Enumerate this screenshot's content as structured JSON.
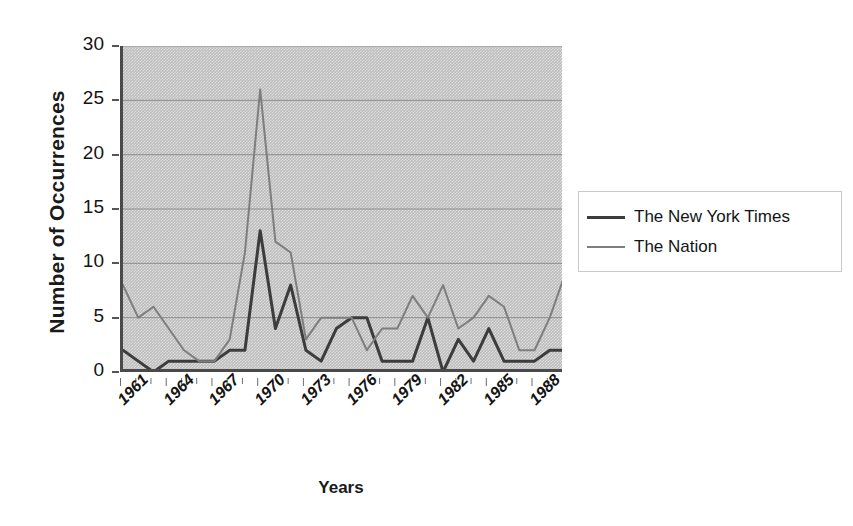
{
  "chart_data": {
    "type": "line",
    "title": "",
    "xlabel": "Years",
    "ylabel": "Number of Occurrences",
    "ylim": [
      0,
      30
    ],
    "ytick_labels": [
      "30",
      "25",
      "20",
      "15",
      "10",
      "5",
      "0"
    ],
    "ytick_values": [
      30,
      25,
      20,
      15,
      10,
      5,
      0
    ],
    "grid": true,
    "legend_position": "right",
    "x": [
      1961,
      1962,
      1963,
      1964,
      1965,
      1966,
      1967,
      1968,
      1969,
      1970,
      1971,
      1972,
      1973,
      1974,
      1975,
      1976,
      1977,
      1978,
      1979,
      1980,
      1981,
      1982,
      1983,
      1984,
      1985,
      1986,
      1987,
      1988,
      1989,
      1990
    ],
    "xtick_labels": [
      "1961",
      "1964",
      "1967",
      "1970",
      "1973",
      "1976",
      "1979",
      "1982",
      "1985",
      "1988"
    ],
    "xtick_values": [
      1961,
      1964,
      1967,
      1970,
      1973,
      1976,
      1979,
      1982,
      1985,
      1988
    ],
    "series": [
      {
        "name": "The New York Times",
        "color": "#3c3c3c",
        "linewidth": 3,
        "values": [
          2,
          1,
          0,
          1,
          1,
          1,
          1,
          2,
          2,
          13,
          4,
          8,
          2,
          1,
          4,
          5,
          5,
          1,
          1,
          1,
          5,
          0,
          3,
          1,
          4,
          1,
          1,
          1,
          2,
          2
        ]
      },
      {
        "name": "The Nation",
        "color": "#7e7e7e",
        "linewidth": 2,
        "values": [
          8,
          5,
          6,
          4,
          2,
          1,
          1,
          3,
          11,
          26,
          12,
          11,
          3,
          5,
          5,
          5,
          2,
          4,
          4,
          7,
          5,
          8,
          4,
          5,
          7,
          6,
          2,
          2,
          5,
          9
        ]
      }
    ]
  },
  "axes": {
    "y_title": "Number of Occurrences",
    "x_title": "Years"
  },
  "legend": {
    "entries": [
      {
        "label": "The New York Times",
        "swatch": "nyt"
      },
      {
        "label": "The Nation",
        "swatch": "nation"
      }
    ]
  }
}
